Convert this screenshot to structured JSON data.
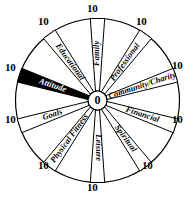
{
  "diagram": {
    "type": "radial-spoke-wheel",
    "center_value": "0",
    "outer_value": "10",
    "scale_min": 0,
    "scale_max": 10,
    "stroke_color": "#000000",
    "background_color": "#ffffff",
    "highlight_color": "#000000",
    "highlight_text_color": "#ffffff",
    "segment_count": 10,
    "segments": [
      {
        "label": "Family",
        "angle_deg": -90,
        "highlighted": false,
        "tick": "10"
      },
      {
        "label": "Professional",
        "angle_deg": -54,
        "highlighted": false,
        "tick": "10"
      },
      {
        "label": "Community/Charity",
        "angle_deg": -18,
        "highlighted": false,
        "tick": "10"
      },
      {
        "label": "Financial",
        "angle_deg": 18,
        "highlighted": false,
        "tick": "10"
      },
      {
        "label": "Spiritual",
        "angle_deg": 54,
        "highlighted": false,
        "tick": "10"
      },
      {
        "label": "Leisure",
        "angle_deg": 90,
        "highlighted": false,
        "tick": "10"
      },
      {
        "label": "Physical Fitness",
        "angle_deg": 126,
        "highlighted": false,
        "tick": "10"
      },
      {
        "label": "Goals",
        "angle_deg": 162,
        "highlighted": false,
        "tick": "10"
      },
      {
        "label": "Attitude",
        "angle_deg": 198,
        "highlighted": true,
        "tick": "10"
      },
      {
        "label": "Educational",
        "angle_deg": 234,
        "highlighted": false,
        "tick": "10"
      }
    ],
    "ticks": [
      {
        "value": "10",
        "position": "top"
      },
      {
        "value": "10",
        "position": "upper-right"
      },
      {
        "value": "10",
        "position": "right-upper"
      },
      {
        "value": "10",
        "position": "right-lower"
      },
      {
        "value": "10",
        "position": "lower-right"
      },
      {
        "value": "10",
        "position": "bottom"
      },
      {
        "value": "10",
        "position": "lower-left"
      },
      {
        "value": "10",
        "position": "left-lower"
      },
      {
        "value": "10",
        "position": "left-upper"
      },
      {
        "value": "10",
        "position": "upper-left"
      }
    ]
  }
}
